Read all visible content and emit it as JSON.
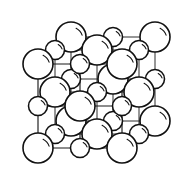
{
  "figure": {
    "kind": "crystal-structure-diagram",
    "projection": "oblique",
    "background_color": "#ffffff",
    "line_color": "#111111",
    "sphere_fill_color": "#ffffff",
    "canvas": {
      "width": 185,
      "height": 185
    }
  },
  "lattice": {
    "type": "rocksalt",
    "grid_size": [
      3,
      3,
      3
    ],
    "site_count": 27,
    "large_radius": 15,
    "small_radius": 9.5,
    "front_origin": [
      38,
      148
    ],
    "cell_step_x": 42,
    "cell_step_y": -42,
    "depth_offset_x": 33,
    "depth_offset_y": -27,
    "species": [
      {
        "name": "large-ion",
        "radius": 15,
        "role": "anion"
      },
      {
        "name": "small-ion",
        "radius": 9.5,
        "role": "cation"
      }
    ],
    "sites": [
      {
        "id": "s-000",
        "i": 0,
        "j": 0,
        "k": 0,
        "cx": 38,
        "cy": 148,
        "r": 15,
        "size": "large"
      },
      {
        "id": "s-100",
        "i": 1,
        "j": 0,
        "k": 0,
        "cx": 80,
        "cy": 148,
        "r": 9.5,
        "size": "small"
      },
      {
        "id": "s-200",
        "i": 2,
        "j": 0,
        "k": 0,
        "cx": 122,
        "cy": 148,
        "r": 15,
        "size": "large"
      },
      {
        "id": "s-010",
        "i": 0,
        "j": 1,
        "k": 0,
        "cx": 38,
        "cy": 106,
        "r": 9.5,
        "size": "small"
      },
      {
        "id": "s-110",
        "i": 1,
        "j": 1,
        "k": 0,
        "cx": 80,
        "cy": 106,
        "r": 15,
        "size": "large"
      },
      {
        "id": "s-210",
        "i": 2,
        "j": 1,
        "k": 0,
        "cx": 122,
        "cy": 106,
        "r": 9.5,
        "size": "small"
      },
      {
        "id": "s-020",
        "i": 0,
        "j": 2,
        "k": 0,
        "cx": 38,
        "cy": 64,
        "r": 15,
        "size": "large"
      },
      {
        "id": "s-120",
        "i": 1,
        "j": 2,
        "k": 0,
        "cx": 80,
        "cy": 64,
        "r": 9.5,
        "size": "small"
      },
      {
        "id": "s-220",
        "i": 2,
        "j": 2,
        "k": 0,
        "cx": 122,
        "cy": 64,
        "r": 15,
        "size": "large"
      },
      {
        "id": "s-001",
        "i": 0,
        "j": 0,
        "k": 1,
        "cx": 55,
        "cy": 134,
        "r": 9.5,
        "size": "small"
      },
      {
        "id": "s-101",
        "i": 1,
        "j": 0,
        "k": 1,
        "cx": 97,
        "cy": 134,
        "r": 15,
        "size": "large"
      },
      {
        "id": "s-201",
        "i": 2,
        "j": 0,
        "k": 1,
        "cx": 139,
        "cy": 134,
        "r": 9.5,
        "size": "small"
      },
      {
        "id": "s-011",
        "i": 0,
        "j": 1,
        "k": 1,
        "cx": 55,
        "cy": 92,
        "r": 15,
        "size": "large"
      },
      {
        "id": "s-111",
        "i": 1,
        "j": 1,
        "k": 1,
        "cx": 97,
        "cy": 92,
        "r": 9.5,
        "size": "small"
      },
      {
        "id": "s-211",
        "i": 2,
        "j": 1,
        "k": 1,
        "cx": 139,
        "cy": 92,
        "r": 15,
        "size": "large"
      },
      {
        "id": "s-021",
        "i": 0,
        "j": 2,
        "k": 1,
        "cx": 55,
        "cy": 50,
        "r": 9.5,
        "size": "small"
      },
      {
        "id": "s-121",
        "i": 1,
        "j": 2,
        "k": 1,
        "cx": 97,
        "cy": 50,
        "r": 15,
        "size": "large"
      },
      {
        "id": "s-221",
        "i": 2,
        "j": 2,
        "k": 1,
        "cx": 139,
        "cy": 50,
        "r": 9.5,
        "size": "small"
      },
      {
        "id": "s-002",
        "i": 0,
        "j": 0,
        "k": 2,
        "cx": 71,
        "cy": 121,
        "r": 15,
        "size": "large"
      },
      {
        "id": "s-102",
        "i": 1,
        "j": 0,
        "k": 2,
        "cx": 113,
        "cy": 121,
        "r": 9.5,
        "size": "small"
      },
      {
        "id": "s-202",
        "i": 2,
        "j": 0,
        "k": 2,
        "cx": 155,
        "cy": 121,
        "r": 15,
        "size": "large"
      },
      {
        "id": "s-012",
        "i": 0,
        "j": 1,
        "k": 2,
        "cx": 71,
        "cy": 79,
        "r": 9.5,
        "size": "small"
      },
      {
        "id": "s-112",
        "i": 1,
        "j": 1,
        "k": 2,
        "cx": 113,
        "cy": 79,
        "r": 15,
        "size": "large"
      },
      {
        "id": "s-212",
        "i": 2,
        "j": 1,
        "k": 2,
        "cx": 155,
        "cy": 79,
        "r": 9.5,
        "size": "small"
      },
      {
        "id": "s-022",
        "i": 0,
        "j": 2,
        "k": 2,
        "cx": 71,
        "cy": 37,
        "r": 15,
        "size": "large"
      },
      {
        "id": "s-122",
        "i": 1,
        "j": 2,
        "k": 2,
        "cx": 113,
        "cy": 37,
        "r": 9.5,
        "size": "small"
      },
      {
        "id": "s-222",
        "i": 2,
        "j": 2,
        "k": 2,
        "cx": 155,
        "cy": 37,
        "r": 15,
        "size": "large"
      }
    ]
  }
}
